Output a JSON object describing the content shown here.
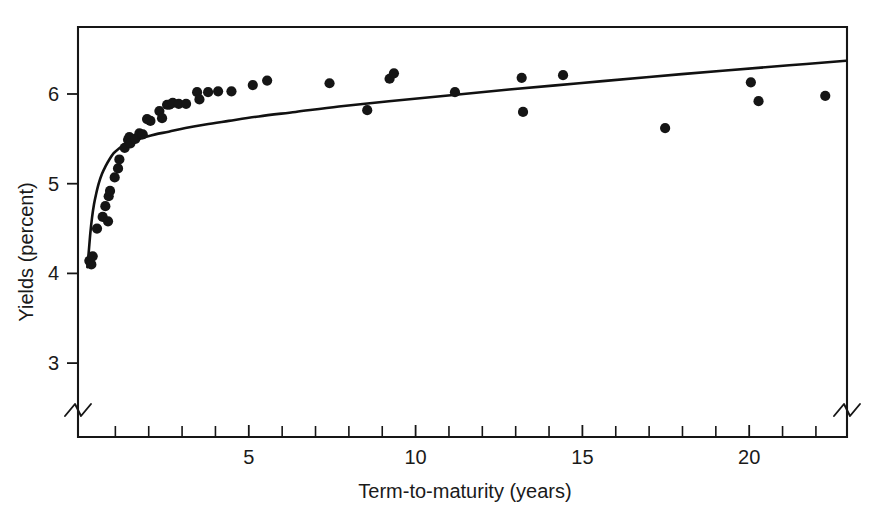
{
  "figure": {
    "background_color": "#ffffff",
    "ink_color": "#151515"
  },
  "chart_data": {
    "type": "scatter",
    "title": "",
    "subtitle": "",
    "xlabel": "Term-to-maturity (years)",
    "ylabel": "Yields (percent)",
    "xlim": [
      0,
      23
    ],
    "ylim": [
      2.55,
      6.6
    ],
    "grid": false,
    "legend": null,
    "legend_position": "none",
    "axis_break": {
      "x_axis_left": true,
      "x_axis_right": true,
      "y_axis_bottom": true,
      "note": "zigzag break marks on both ends of the x axis and at the base of the y axis"
    },
    "xticks_major": [
      5,
      10,
      15,
      20
    ],
    "xtick_labels": [
      "5",
      "10",
      "15",
      "20"
    ],
    "xticks_minor": [
      1,
      2,
      3,
      4,
      6,
      7,
      8,
      9,
      11,
      12,
      13,
      14,
      16,
      17,
      18,
      19,
      21,
      22
    ],
    "yticks": [
      3,
      4,
      5,
      6
    ],
    "ytick_labels": [
      "3",
      "4",
      "5",
      "6"
    ],
    "series": [
      {
        "name": "Observed yields",
        "type": "scatter",
        "marker": "filled-circle",
        "color": "#151515",
        "points": [
          [
            0.22,
            4.14
          ],
          [
            0.28,
            4.1
          ],
          [
            0.32,
            4.19
          ],
          [
            0.45,
            4.5
          ],
          [
            0.62,
            4.63
          ],
          [
            0.7,
            4.75
          ],
          [
            0.78,
            4.58
          ],
          [
            0.8,
            4.86
          ],
          [
            0.84,
            4.92
          ],
          [
            0.98,
            5.07
          ],
          [
            1.08,
            5.17
          ],
          [
            1.12,
            5.27
          ],
          [
            1.28,
            5.4
          ],
          [
            1.38,
            5.49
          ],
          [
            1.42,
            5.52
          ],
          [
            1.45,
            5.45
          ],
          [
            1.6,
            5.5
          ],
          [
            1.72,
            5.56
          ],
          [
            1.82,
            5.55
          ],
          [
            1.95,
            5.72
          ],
          [
            2.05,
            5.7
          ],
          [
            2.32,
            5.81
          ],
          [
            2.4,
            5.73
          ],
          [
            2.55,
            5.88
          ],
          [
            2.62,
            5.88
          ],
          [
            2.72,
            5.9
          ],
          [
            2.9,
            5.89
          ],
          [
            3.12,
            5.89
          ],
          [
            3.45,
            6.02
          ],
          [
            3.52,
            5.94
          ],
          [
            3.78,
            6.02
          ],
          [
            4.08,
            6.03
          ],
          [
            4.48,
            6.03
          ],
          [
            5.12,
            6.1
          ],
          [
            5.55,
            6.15
          ],
          [
            7.42,
            6.12
          ],
          [
            8.55,
            5.82
          ],
          [
            9.22,
            6.17
          ],
          [
            9.35,
            6.23
          ],
          [
            11.18,
            6.02
          ],
          [
            13.18,
            6.18
          ],
          [
            13.22,
            5.8
          ],
          [
            14.42,
            6.21
          ],
          [
            17.48,
            5.62
          ],
          [
            20.05,
            6.13
          ],
          [
            20.28,
            5.92
          ],
          [
            22.28,
            5.98
          ]
        ]
      },
      {
        "name": "Fitted yield curve",
        "type": "line",
        "color": "#111111",
        "points": [
          [
            0.16,
            4.07
          ],
          [
            0.2,
            4.23
          ],
          [
            0.25,
            4.45
          ],
          [
            0.3,
            4.62
          ],
          [
            0.36,
            4.77
          ],
          [
            0.42,
            4.88
          ],
          [
            0.5,
            5.0
          ],
          [
            0.6,
            5.11
          ],
          [
            0.7,
            5.19
          ],
          [
            0.82,
            5.27
          ],
          [
            0.95,
            5.34
          ],
          [
            1.1,
            5.39
          ],
          [
            1.25,
            5.43
          ],
          [
            1.45,
            5.47
          ],
          [
            1.65,
            5.49
          ],
          [
            1.9,
            5.52
          ],
          [
            2.2,
            5.55
          ],
          [
            2.6,
            5.58
          ],
          [
            3.1,
            5.62
          ],
          [
            3.7,
            5.66
          ],
          [
            4.4,
            5.7
          ],
          [
            5.3,
            5.75
          ],
          [
            6.4,
            5.8
          ],
          [
            7.7,
            5.86
          ],
          [
            9.2,
            5.92
          ],
          [
            10.9,
            5.98
          ],
          [
            12.8,
            6.05
          ],
          [
            14.9,
            6.12
          ],
          [
            17.0,
            6.19
          ],
          [
            19.2,
            6.26
          ],
          [
            21.2,
            6.32
          ],
          [
            22.9,
            6.37
          ]
        ]
      }
    ]
  }
}
